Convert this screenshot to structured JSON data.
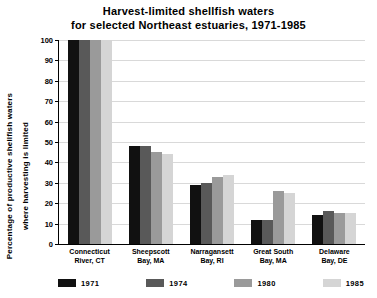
{
  "chart_data": {
    "type": "bar",
    "title": "Harvest-limited shellfish waters for selected Northeast estuaries, 1971-1985",
    "title_line1": "Harvest-limited shellfish waters",
    "title_line2": "for selected Northeast estuaries, 1971-1985",
    "xlabel": "",
    "ylabel": "Percentage of productive shellfish waters where harvesting is limited",
    "ylabel_line1": "Percentage of productive shellfish waters",
    "ylabel_line2": "where harvesting is limited",
    "ylim": [
      0,
      100
    ],
    "yticks": [
      0,
      10,
      20,
      30,
      40,
      50,
      60,
      70,
      80,
      90,
      100
    ],
    "grid": true,
    "legend_position": "bottom",
    "categories": [
      "Connecticut River, CT",
      "Sheepscott Bay, MA",
      "Narragansett Bay, RI",
      "Great South Bay, MA",
      "Delaware Bay, DE"
    ],
    "category_lines": [
      [
        "Connecticut",
        "River, CT"
      ],
      [
        "Sheepscott",
        "Bay, MA"
      ],
      [
        "Narragansett",
        "Bay, RI"
      ],
      [
        "Great South",
        "Bay, MA"
      ],
      [
        "Delaware",
        "Bay, DE"
      ]
    ],
    "series": [
      {
        "name": "1971",
        "color": "#111111",
        "values": [
          100,
          48,
          29,
          12,
          14
        ]
      },
      {
        "name": "1974",
        "color": "#595959",
        "values": [
          100,
          48,
          30,
          12,
          16
        ]
      },
      {
        "name": "1980",
        "color": "#9a9a9a",
        "values": [
          100,
          45,
          33,
          26,
          15
        ]
      },
      {
        "name": "1985",
        "color": "#d5d5d5",
        "values": [
          100,
          44,
          34,
          25,
          15
        ]
      }
    ]
  },
  "legend": {
    "items": [
      {
        "label": "1971"
      },
      {
        "label": "1974"
      },
      {
        "label": "1980"
      },
      {
        "label": "1985"
      }
    ]
  }
}
